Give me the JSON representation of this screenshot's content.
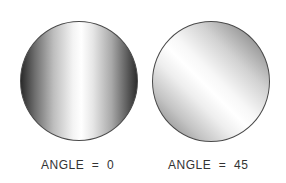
{
  "figures": [
    {
      "label": "ANGLE  =  0",
      "angle": 0,
      "shading": "vertical band highlight"
    },
    {
      "label": "ANGLE  =  45",
      "angle": 45,
      "shading": "diagonal band highlight"
    }
  ]
}
